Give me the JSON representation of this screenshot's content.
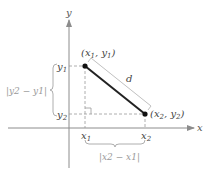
{
  "diagram": {
    "type": "distance-between-two-points",
    "axes": {
      "x_label": "x",
      "y_label": "y"
    },
    "points": [
      {
        "label": "(x1, y1)",
        "var": "x",
        "sub": "1",
        "var2": "y",
        "sub2": "1"
      },
      {
        "label": "(x2, y2)",
        "var": "x",
        "sub": "2",
        "var2": "y",
        "sub2": "2"
      }
    ],
    "segment_label": "d",
    "ticks": {
      "x1": {
        "var": "x",
        "sub": "1"
      },
      "x2": {
        "var": "x",
        "sub": "2"
      },
      "y1": {
        "var": "y",
        "sub": "1"
      },
      "y2": {
        "var": "y",
        "sub": "2"
      }
    },
    "vertical_distance": "|y2 − y1|",
    "horizontal_distance": "|x2 − x1|",
    "colors": {
      "axis": "#8c8c8c",
      "segment": "#222222",
      "dashed": "#999999",
      "brace": "#999999",
      "d_line": "#b0b0b0"
    }
  }
}
